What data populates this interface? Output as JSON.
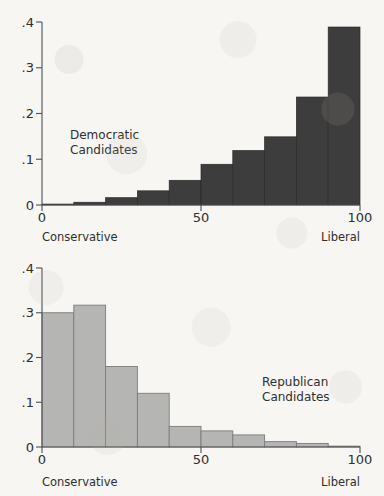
{
  "page": {
    "background_color": "#f7f6f3",
    "width": 384,
    "height": 496
  },
  "chart_data": [
    {
      "id": "democratic",
      "type": "bar",
      "title": "",
      "annotation": "Democratic\nCandidates",
      "annotation_line1": "Democratic",
      "annotation_line2": "Candidates",
      "xlabel": "",
      "ylabel": "",
      "xlim": [
        0,
        100
      ],
      "ylim": [
        0,
        0.4
      ],
      "grid": false,
      "legend": "none",
      "bar_color": "#3d3d3d",
      "bin_edges": [
        0,
        10,
        20,
        30,
        40,
        50,
        60,
        70,
        80,
        90,
        100
      ],
      "categories": [
        "0-10",
        "10-20",
        "20-30",
        "30-40",
        "40-50",
        "50-60",
        "60-70",
        "70-80",
        "80-90",
        "90-100"
      ],
      "values": [
        0.002,
        0.006,
        0.016,
        0.031,
        0.054,
        0.089,
        0.119,
        0.149,
        0.236,
        0.389
      ],
      "x_ticks": [
        0,
        50,
        100
      ],
      "x_tick_labels": [
        "0",
        "50",
        "100"
      ],
      "y_ticks": [
        0,
        0.1,
        0.2,
        0.3,
        0.4
      ],
      "y_tick_labels": [
        "0",
        ".1",
        ".2",
        ".3",
        ".4"
      ],
      "endpoint_labels": {
        "left": "Conservative",
        "right": "Liberal"
      }
    },
    {
      "id": "republican",
      "type": "bar",
      "title": "",
      "annotation": "Republican\nCandidates",
      "annotation_line1": "Republican",
      "annotation_line2": "Candidates",
      "xlabel": "",
      "ylabel": "",
      "xlim": [
        0,
        100
      ],
      "ylim": [
        0,
        0.4
      ],
      "grid": false,
      "legend": "none",
      "bar_color": "#b5b5b3",
      "bin_edges": [
        0,
        10,
        20,
        30,
        40,
        50,
        60,
        70,
        80,
        90,
        100
      ],
      "categories": [
        "0-10",
        "10-20",
        "20-30",
        "30-40",
        "40-50",
        "50-60",
        "60-70",
        "70-80",
        "80-90",
        "90-100"
      ],
      "values": [
        0.3,
        0.317,
        0.18,
        0.12,
        0.046,
        0.036,
        0.027,
        0.012,
        0.008,
        0.002
      ],
      "x_ticks": [
        0,
        50,
        100
      ],
      "x_tick_labels": [
        "0",
        "50",
        "100"
      ],
      "y_ticks": [
        0,
        0.1,
        0.2,
        0.3,
        0.4
      ],
      "y_tick_labels": [
        "0",
        ".1",
        ".2",
        ".3",
        ".4"
      ],
      "endpoint_labels": {
        "left": "Conservative",
        "right": "Liberal"
      }
    }
  ]
}
